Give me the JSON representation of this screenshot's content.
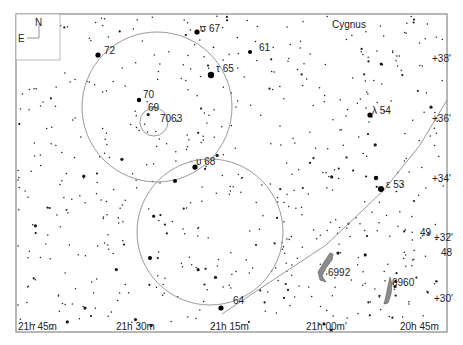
{
  "chart_title": "Star chart - Cygnus region",
  "frame": {
    "x": 16,
    "y": 14,
    "w": 431,
    "h": 318,
    "color": "#888888"
  },
  "compass": {
    "north": "N",
    "east": "E"
  },
  "constellation_label": {
    "text": "Cygnus",
    "x": 332,
    "y": 28
  },
  "ra_labels": [
    {
      "text": "21h 45m",
      "x": 18,
      "y": 332
    },
    {
      "text": "21h 30m",
      "x": 116,
      "y": 332
    },
    {
      "text": "21h 15m",
      "x": 210,
      "y": 332
    },
    {
      "text": "21h 00m'",
      "x": 306,
      "y": 332
    },
    {
      "text": "20h 45m",
      "x": 400,
      "y": 332
    }
  ],
  "dec_labels": [
    {
      "text": "+38'",
      "x": 432,
      "y": 62
    },
    {
      "text": "+36'",
      "x": 432,
      "y": 122
    },
    {
      "text": "+34'",
      "x": 432,
      "y": 182
    },
    {
      "text": "+32'",
      "x": 434,
      "y": 241
    },
    {
      "text": "+30'",
      "x": 434,
      "y": 302
    }
  ],
  "star_labels": [
    {
      "text": "σ 67",
      "x": 200,
      "y": 32
    },
    {
      "text": "72",
      "x": 104,
      "y": 54
    },
    {
      "text": "61",
      "x": 259,
      "y": 51
    },
    {
      "text": "τ 65",
      "x": 216,
      "y": 72
    },
    {
      "text": "70",
      "x": 143,
      "y": 98
    },
    {
      "text": "69",
      "x": 148,
      "y": 111
    },
    {
      "text": "7063",
      "x": 160,
      "y": 122
    },
    {
      "text": "λ 54",
      "x": 372,
      "y": 114
    },
    {
      "text": "υ 68",
      "x": 196,
      "y": 165
    },
    {
      "text": "ε 53",
      "x": 386,
      "y": 188
    },
    {
      "text": "49",
      "x": 420,
      "y": 236
    },
    {
      "text": "48",
      "x": 441,
      "y": 256
    },
    {
      "text": "6992",
      "x": 328,
      "y": 276
    },
    {
      "text": "6960",
      "x": 392,
      "y": 286
    },
    {
      "text": "64",
      "x": 233,
      "y": 304
    }
  ],
  "circles": [
    {
      "cx": 157,
      "cy": 107,
      "r": 75
    },
    {
      "cx": 210,
      "cy": 232,
      "r": 73
    },
    {
      "cx": 154,
      "cy": 122,
      "r": 14
    }
  ],
  "ecliptic_line": {
    "points": "222,314 270,282 326,245 384,190 420,145 447,100"
  },
  "nebulae": [
    {
      "name": "6992",
      "path": "M330,253 L324,262 L318,272 L320,280 L326,282 L322,276 L326,268 L332,260 L333,254 Z"
    },
    {
      "name": "6960",
      "path": "M390,277 L388,286 L386,296 L384,304 L388,303 L391,294 L392,284 Z"
    }
  ],
  "bright_stars": [
    {
      "x": 211,
      "y": 75,
      "r": 3.2
    },
    {
      "x": 197,
      "y": 32,
      "r": 2.6
    },
    {
      "x": 98,
      "y": 55,
      "r": 2.6
    },
    {
      "x": 139,
      "y": 100,
      "r": 2.2
    },
    {
      "x": 195,
      "y": 167,
      "r": 2.6
    },
    {
      "x": 381,
      "y": 189,
      "r": 3.0
    },
    {
      "x": 370,
      "y": 115,
      "r": 2.6
    },
    {
      "x": 376,
      "y": 178,
      "r": 2.2
    },
    {
      "x": 221,
      "y": 308,
      "r": 2.6
    },
    {
      "x": 250,
      "y": 52,
      "r": 2.0
    },
    {
      "x": 175,
      "y": 181,
      "r": 2.0
    },
    {
      "x": 150,
      "y": 258,
      "r": 2.0
    }
  ]
}
